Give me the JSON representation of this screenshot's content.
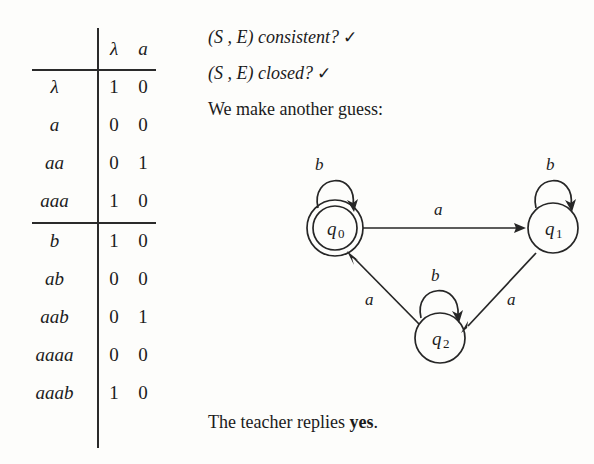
{
  "figure": {
    "background_color": "#fdfdfb",
    "ink_color": "#1b1b1b"
  },
  "observation_table": {
    "name": "observation-table",
    "corner_label": "",
    "column_headers": [
      "λ",
      "a"
    ],
    "upper_rows": [
      {
        "label": "λ",
        "values": [
          "1",
          "0"
        ]
      },
      {
        "label": "a",
        "values": [
          "0",
          "0"
        ]
      },
      {
        "label": "aa",
        "values": [
          "0",
          "1"
        ]
      },
      {
        "label": "aaa",
        "values": [
          "1",
          "0"
        ]
      }
    ],
    "lower_rows": [
      {
        "label": "b",
        "values": [
          "1",
          "0"
        ]
      },
      {
        "label": "ab",
        "values": [
          "0",
          "0"
        ]
      },
      {
        "label": "aab",
        "values": [
          "0",
          "1"
        ]
      },
      {
        "label": "aaaa",
        "values": [
          "0",
          "0"
        ]
      },
      {
        "label": "aaab",
        "values": [
          "1",
          "0"
        ]
      }
    ]
  },
  "prose": {
    "consistent_question": "(S , E) consistent?",
    "consistent_mark": "✓",
    "closed_question": "(S , E) closed?",
    "closed_mark": "✓",
    "guess_line": "We make another guess:",
    "teacher_prefix": "The teacher replies ",
    "teacher_answer": "yes",
    "teacher_suffix": "."
  },
  "automaton": {
    "name": "dfa-guess",
    "states": [
      {
        "id": "q0",
        "label_base": "q",
        "label_sub": "0",
        "accepting": true,
        "cx": 47,
        "cy": 80
      },
      {
        "id": "q1",
        "label_base": "q",
        "label_sub": "1",
        "accepting": false,
        "cx": 265,
        "cy": 80
      },
      {
        "id": "q2",
        "label_base": "q",
        "label_sub": "2",
        "accepting": false,
        "cx": 152,
        "cy": 190
      }
    ],
    "transitions": [
      {
        "from": "q0",
        "to": "q1",
        "label": "a"
      },
      {
        "from": "q1",
        "to": "q2",
        "label": "a"
      },
      {
        "from": "q2",
        "to": "q0",
        "label": "a"
      },
      {
        "from": "q0",
        "to": "q0",
        "label": "b"
      },
      {
        "from": "q1",
        "to": "q1",
        "label": "b"
      },
      {
        "from": "q2",
        "to": "q2",
        "label": "b"
      }
    ],
    "loop_labels": {
      "q0": "b",
      "q1": "b",
      "q2": "b"
    },
    "edge_labels": {
      "q0_q1": "a",
      "q1_q2": "a",
      "q2_q0": "a"
    }
  }
}
